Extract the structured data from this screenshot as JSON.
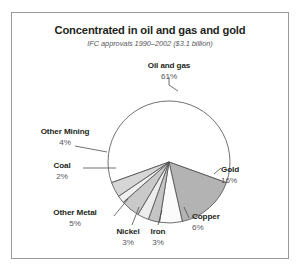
{
  "chart_data": {
    "type": "pie",
    "title": "Concentrated in oil and gas and gold",
    "subtitle": "IFC approvals 1990–2002 ($3.1 billion)",
    "xlabel": "",
    "ylabel": "",
    "legend_position": "none",
    "grid": false,
    "total_label": "$3.1 billion",
    "categories": [
      "Oil and gas",
      "Gold",
      "Copper",
      "Iron",
      "Nickel",
      "Other Metal",
      "Coal",
      "Other Mining"
    ],
    "values": [
      61,
      16,
      6,
      3,
      3,
      5,
      2,
      4
    ],
    "value_labels": [
      "61%",
      "16%",
      "6%",
      "3%",
      "3%",
      "5%",
      "2%",
      "4%"
    ],
    "slice_colors": [
      "#ffffff",
      "#b3b3b3",
      "#fbfbfb",
      "#c4c4c4",
      "#ededed",
      "#c9c9c9",
      "#efefef",
      "#d6d6d6"
    ],
    "slices": [
      {
        "name": "Oil and gas",
        "value": 61,
        "label": "61%",
        "color": "#ffffff"
      },
      {
        "name": "Gold",
        "value": 16,
        "label": "16%",
        "color": "#b3b3b3"
      },
      {
        "name": "Copper",
        "value": 6,
        "label": "6%",
        "color": "#fbfbfb"
      },
      {
        "name": "Iron",
        "value": 3,
        "label": "3%",
        "color": "#c4c4c4"
      },
      {
        "name": "Nickel",
        "value": 3,
        "label": "3%",
        "color": "#ededed"
      },
      {
        "name": "Other Metal",
        "value": 5,
        "label": "5%",
        "color": "#c9c9c9"
      },
      {
        "name": "Coal",
        "value": 2,
        "label": "2%",
        "color": "#efefef"
      },
      {
        "name": "Other Mining",
        "value": 4,
        "label": "4%",
        "color": "#d6d6d6"
      }
    ]
  },
  "colors": {
    "frame_border": "#9a9a9a",
    "title_text": "#231f20",
    "subtitle_text": "#56565a",
    "label_text": "#231f20",
    "value_text": "#56565a",
    "slice_outline": "#4d4d4d",
    "leader_line": "#4d4d4d",
    "background": "#ffffff"
  }
}
